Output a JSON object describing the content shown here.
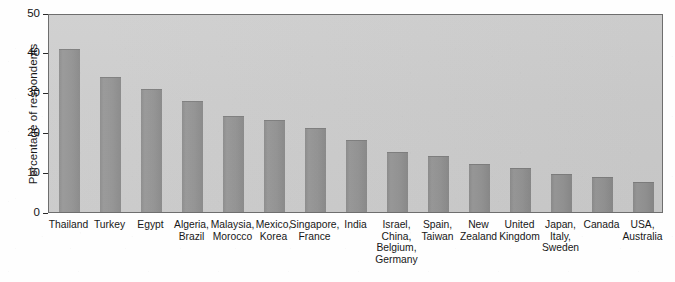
{
  "chart_data": {
    "type": "bar",
    "title": "",
    "xlabel": "",
    "ylabel": "Percentage of respondents",
    "ylim": [
      0,
      50
    ],
    "yticks": [
      0,
      10,
      20,
      30,
      40,
      50
    ],
    "ytick_labels": [
      "0",
      "10",
      "20",
      "30",
      "40",
      "50"
    ],
    "grid": false,
    "legend": null,
    "bar_color": "#919191",
    "plot_background": "#cccccc",
    "categories": [
      "Thailand",
      "Turkey",
      "Egypt",
      "Algeria, Brazil",
      "Malaysia, Morocco",
      "Mexico, Korea",
      "Singapore, France",
      "India",
      "Israel, China, Belgium, Germany",
      "Spain, Taiwan",
      "New Zealand",
      "United Kingdom",
      "Japan, Italy, Sweden",
      "Canada",
      "USA, Australia"
    ],
    "category_lines": [
      [
        "Thailand"
      ],
      [
        "Turkey"
      ],
      [
        "Egypt"
      ],
      [
        "Algeria,",
        "Brazil"
      ],
      [
        "Malaysia,",
        "Morocco"
      ],
      [
        "Mexico,",
        "Korea"
      ],
      [
        "Singapore,",
        "France"
      ],
      [
        "India"
      ],
      [
        "Israel,",
        "China,",
        "Belgium,",
        "Germany"
      ],
      [
        "Spain,",
        "Taiwan"
      ],
      [
        "New",
        "Zealand"
      ],
      [
        "United",
        "Kingdom"
      ],
      [
        "Japan,",
        "Italy,",
        "Sweden"
      ],
      [
        "Canada"
      ],
      [
        "USA,",
        "Australia"
      ]
    ],
    "values": [
      41,
      34,
      31,
      28,
      24,
      23,
      21,
      18,
      15,
      14,
      12,
      11,
      9.5,
      8.8,
      7.5
    ]
  }
}
